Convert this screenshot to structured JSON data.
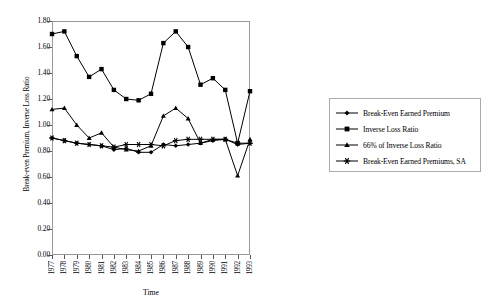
{
  "chart_data": {
    "type": "line",
    "title": "",
    "xlabel": "Time",
    "ylabel": "Break-even Premium, Inverse Loss Ratio",
    "x": [
      1977,
      1978,
      1979,
      1980,
      1981,
      1982,
      1983,
      1984,
      1985,
      1986,
      1987,
      1988,
      1989,
      1990,
      1991,
      1992,
      1993
    ],
    "xtick_labels": [
      "1977",
      "1978",
      "1979",
      "1980",
      "1981",
      "1982",
      "1983",
      "1984",
      "1985",
      "1986",
      "1987",
      "1988",
      "1989",
      "1990",
      "1991",
      "1992",
      "1993"
    ],
    "ytick_labels": [
      "0.00",
      "0.20",
      "0.40",
      "0.60",
      "0.80",
      "1.00",
      "1.20",
      "1.40",
      "1.60",
      "1.80"
    ],
    "ytick_values": [
      0.0,
      0.2,
      0.4,
      0.6,
      0.8,
      1.0,
      1.2,
      1.4,
      1.6,
      1.8
    ],
    "ylim": [
      0.0,
      1.8
    ],
    "xlim": [
      1977,
      1993
    ],
    "grid": false,
    "legend_position": "right",
    "series": [
      {
        "name": "Break-Even Earned Premium",
        "marker": "diamond",
        "values": [
          0.9,
          0.88,
          0.86,
          0.85,
          0.84,
          0.81,
          0.82,
          0.79,
          0.79,
          0.85,
          0.84,
          0.85,
          0.86,
          0.88,
          0.89,
          0.85,
          0.86
        ]
      },
      {
        "name": "Inverse Loss Ratio",
        "marker": "square",
        "values": [
          1.7,
          1.72,
          1.53,
          1.37,
          1.43,
          1.27,
          1.2,
          1.19,
          1.24,
          1.63,
          1.72,
          1.6,
          1.31,
          1.36,
          1.27,
          0.86,
          1.26
        ]
      },
      {
        "name": "66% of Inverse Loss Ratio",
        "marker": "triangle",
        "values": [
          1.12,
          1.13,
          1.0,
          0.9,
          0.94,
          0.83,
          0.81,
          0.8,
          0.84,
          1.07,
          1.13,
          1.05,
          0.86,
          0.89,
          0.89,
          0.61,
          0.89
        ]
      },
      {
        "name": "Break-Even Earned Premiums, SA",
        "marker": "star",
        "values": [
          0.9,
          0.88,
          0.86,
          0.85,
          0.84,
          0.83,
          0.85,
          0.85,
          0.85,
          0.84,
          0.88,
          0.89,
          0.89,
          0.89,
          0.89,
          0.86,
          0.86
        ]
      }
    ]
  }
}
